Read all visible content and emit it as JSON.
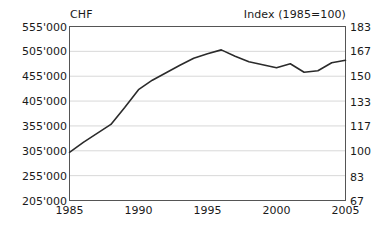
{
  "chart_data": {
    "type": "line",
    "title": "",
    "left_axis_title": "CHF",
    "right_axis_title": "Index (1985=100)",
    "xlabel": "",
    "ylabel": "CHF",
    "grid": true,
    "legend": "none",
    "xlim": [
      1985,
      2005
    ],
    "ylim": [
      205000,
      555000
    ],
    "ylim_right": [
      67,
      183
    ],
    "x_ticks": [
      1985,
      1990,
      1995,
      2000,
      2005
    ],
    "x_tick_labels": [
      "1985",
      "1990",
      "1995",
      "2000",
      "2005"
    ],
    "y_ticks_left": [
      205000,
      255000,
      305000,
      355000,
      405000,
      455000,
      505000,
      555000
    ],
    "y_tick_labels_left": [
      "205'000",
      "255'000",
      "305'000",
      "355'000",
      "405'000",
      "455'000",
      "505'000",
      "555'000"
    ],
    "y_ticks_right": [
      67,
      83,
      100,
      117,
      133,
      150,
      167,
      183
    ],
    "y_tick_labels_right": [
      "67",
      "83",
      "100",
      "117",
      "133",
      "150",
      "167",
      "183"
    ],
    "series": [
      {
        "name": "CHF",
        "color": "#2b2b2b",
        "x": [
          1985,
          1986,
          1987,
          1988,
          1989,
          1990,
          1991,
          1992,
          1993,
          1994,
          1995,
          1996,
          1997,
          1998,
          1999,
          2000,
          2001,
          2002,
          2003,
          2004,
          2005
        ],
        "values": [
          302000,
          322000,
          340000,
          358000,
          392000,
          428000,
          447000,
          462000,
          477000,
          491000,
          500000,
          508000,
          495000,
          484000,
          478000,
          472000,
          480000,
          463000,
          466000,
          482000,
          487000
        ]
      }
    ]
  },
  "axes": {
    "left_title": "CHF",
    "right_title": "Index (1985=100)"
  }
}
